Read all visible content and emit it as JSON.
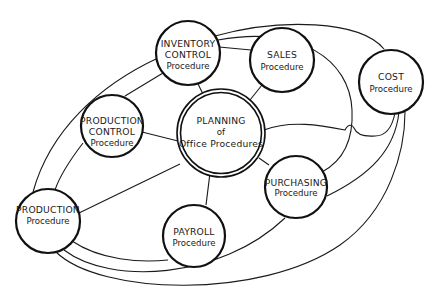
{
  "diagram": {
    "center": {
      "id": "planning",
      "lines": [
        "PLANNING",
        "of",
        "Office Procedures"
      ]
    },
    "nodes": [
      {
        "id": "inventory-control",
        "lines": [
          "INVENTORY",
          "CONTROL",
          "Procedure"
        ]
      },
      {
        "id": "sales",
        "lines": [
          "SALES",
          "Procedure"
        ]
      },
      {
        "id": "cost",
        "lines": [
          "COST",
          "Procedure"
        ]
      },
      {
        "id": "production-control",
        "lines": [
          "PRODUCTION",
          "CONTROL",
          "Procedure"
        ]
      },
      {
        "id": "production",
        "lines": [
          "PRODUCTION",
          "Procedure"
        ]
      },
      {
        "id": "payroll",
        "lines": [
          "PAYROLL",
          "Procedure"
        ]
      },
      {
        "id": "purchasing",
        "lines": [
          "PURCHASING",
          "Procedure"
        ]
      }
    ],
    "connections": [
      [
        "planning",
        "inventory-control"
      ],
      [
        "planning",
        "sales"
      ],
      [
        "planning",
        "cost"
      ],
      [
        "planning",
        "production-control"
      ],
      [
        "planning",
        "production"
      ],
      [
        "planning",
        "payroll"
      ],
      [
        "planning",
        "purchasing"
      ],
      [
        "inventory-control",
        "sales"
      ],
      [
        "inventory-control",
        "production-control"
      ],
      [
        "inventory-control",
        "cost"
      ],
      [
        "inventory-control",
        "production"
      ],
      [
        "sales",
        "purchasing"
      ],
      [
        "production-control",
        "production"
      ],
      [
        "production",
        "payroll"
      ],
      [
        "production",
        "purchasing"
      ],
      [
        "production",
        "cost"
      ],
      [
        "cost",
        "purchasing"
      ]
    ],
    "colors": {
      "stroke": "#111111",
      "background": "#ffffff",
      "text": "#1a1a1a"
    }
  }
}
